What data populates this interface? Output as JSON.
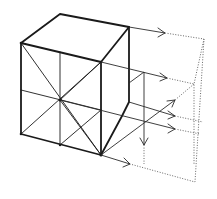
{
  "diagram": {
    "colors": {
      "ink": "#1a1a1a",
      "dotted": "#555555",
      "background": "#ffffff"
    },
    "cube": {
      "front_face": [
        [
          21,
          43
        ],
        [
          101,
          62
        ],
        [
          101,
          155
        ],
        [
          21,
          134
        ]
      ],
      "top_back": [
        [
          60,
          14
        ],
        [
          129,
          27
        ]
      ],
      "right_back_bottom": [
        129,
        102
      ],
      "center": [
        60,
        100
      ]
    },
    "projection_arrows": [
      {
        "from": [
          129,
          27
        ],
        "to": [
          165,
          33
        ]
      },
      {
        "from": [
          101,
          62
        ],
        "to": [
          167,
          78
        ]
      },
      {
        "from": [
          101,
          155
        ],
        "to": [
          130,
          164
        ]
      },
      {
        "from": [
          60,
          100
        ],
        "to": [
          175,
          130
        ]
      },
      {
        "from": [
          129,
          102
        ],
        "to": [
          175,
          116
        ]
      },
      {
        "from": [
          101,
          155
        ],
        "to": [
          175,
          100
        ]
      },
      {
        "from": [
          144,
          72
        ],
        "to": [
          144,
          145
        ]
      }
    ],
    "projection_plane": [
      [
        165,
        33
      ],
      [
        204,
        39
      ],
      [
        195,
        182
      ],
      [
        130,
        164
      ]
    ]
  }
}
